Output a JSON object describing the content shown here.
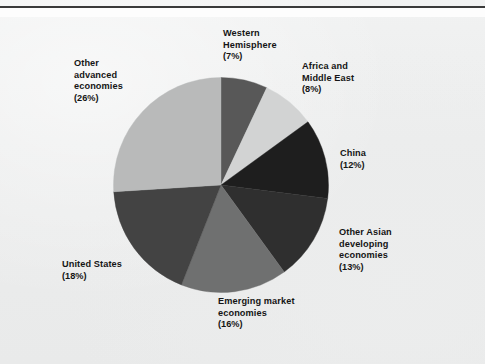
{
  "figure": {
    "background_color": "#eceded",
    "rule_color": "#3a3a3a"
  },
  "chart_data": {
    "type": "pie",
    "title": "",
    "subtitle": "",
    "xlabel": "",
    "ylabel": "",
    "grid": false,
    "legend_position": "outside-labels",
    "units": "percent",
    "total": 100,
    "start_angle_deg": 0,
    "direction": "clockwise",
    "categories": [
      "Western Hemisphere",
      "Africa and Middle East",
      "China",
      "Other Asian developing economies",
      "Emerging market economies",
      "United States",
      "Other advanced economies"
    ],
    "values": [
      7,
      8,
      12,
      13,
      16,
      18,
      26
    ],
    "colors": [
      "#585858",
      "#d2d3d3",
      "#1e1e1e",
      "#2f2f2f",
      "#6f7070",
      "#434343",
      "#b9baba"
    ],
    "slices": [
      {
        "name": "Western Hemisphere",
        "value": 7,
        "label_pct": "(7%)",
        "color": "#585858"
      },
      {
        "name": "Africa and Middle East",
        "value": 8,
        "label_pct": "(8%)",
        "color": "#d2d3d3"
      },
      {
        "name": "China",
        "value": 12,
        "label_pct": "(12%)",
        "color": "#1e1e1e"
      },
      {
        "name": "Other Asian developing economies",
        "value": 13,
        "label_pct": "(13%)",
        "color": "#2f2f2f"
      },
      {
        "name": "Emerging market economies",
        "value": 16,
        "label_pct": "(16%)",
        "color": "#6f7070"
      },
      {
        "name": "United States",
        "value": 18,
        "label_pct": "(18%)",
        "color": "#434343"
      },
      {
        "name": "Other advanced economies",
        "value": 26,
        "label_pct": "(26%)",
        "color": "#b9baba"
      }
    ]
  },
  "labels": {
    "western": {
      "line1": "Western",
      "line2": "Hemisphere",
      "line3": "",
      "pct": "(7%)"
    },
    "africa": {
      "line1": "Africa and",
      "line2": "Middle East",
      "line3": "",
      "pct": "(8%)"
    },
    "china": {
      "line1": "China",
      "line2": "",
      "line3": "",
      "pct": "(12%)"
    },
    "asian": {
      "line1": "Other Asian",
      "line2": "developing",
      "line3": "economies",
      "pct": "(13%)"
    },
    "emerging": {
      "line1": "Emerging market",
      "line2": "economies",
      "line3": "",
      "pct": "(16%)"
    },
    "us": {
      "line1": "United States",
      "line2": "",
      "line3": "",
      "pct": "(18%)"
    },
    "advanced": {
      "line1": "Other",
      "line2": "advanced",
      "line3": "economies",
      "pct": "(26%)"
    }
  }
}
